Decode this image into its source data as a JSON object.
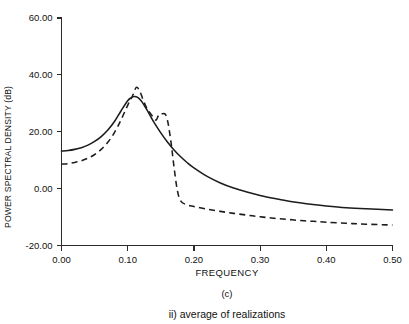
{
  "figure": {
    "panel_label": "(c)",
    "caption": "ii) average of realizations"
  },
  "chart_data": {
    "type": "line",
    "title": "",
    "xlabel": "FREQUENCY",
    "ylabel": "POWER SPECTRAL DENSITY (dB)",
    "xlim": [
      0.0,
      0.5
    ],
    "ylim": [
      -20.0,
      60.0
    ],
    "grid": false,
    "legend": "none",
    "xticks": [
      0.0,
      0.1,
      0.2,
      0.3,
      0.4,
      0.5
    ],
    "xticklabels": [
      "0.00",
      "0.10",
      "0.20",
      "0.30",
      "0.40",
      "0.50"
    ],
    "yticks": [
      -20.0,
      0.0,
      20.0,
      40.0,
      60.0
    ],
    "yticklabels": [
      "-20.00",
      "0.00",
      "20.00",
      "40.00",
      "60.00"
    ],
    "series": [
      {
        "name": "solid-curve",
        "style": "solid",
        "color": "#1c1c1c",
        "x": [
          0.0,
          0.01,
          0.02,
          0.03,
          0.04,
          0.05,
          0.06,
          0.07,
          0.08,
          0.09,
          0.1,
          0.105,
          0.11,
          0.115,
          0.12,
          0.125,
          0.13,
          0.135,
          0.14,
          0.15,
          0.16,
          0.17,
          0.18,
          0.19,
          0.2,
          0.22,
          0.24,
          0.26,
          0.28,
          0.3,
          0.32,
          0.34,
          0.36,
          0.38,
          0.4,
          0.43,
          0.46,
          0.5
        ],
        "y": [
          13.2,
          13.4,
          13.8,
          14.4,
          15.3,
          16.6,
          18.3,
          20.6,
          23.6,
          27.4,
          30.9,
          31.9,
          32.4,
          32.1,
          31.0,
          29.3,
          27.3,
          25.2,
          23.2,
          19.6,
          16.4,
          13.6,
          11.2,
          9.1,
          7.3,
          4.3,
          2.0,
          0.2,
          -1.2,
          -2.4,
          -3.4,
          -4.3,
          -5.0,
          -5.6,
          -6.1,
          -6.7,
          -7.1,
          -7.5
        ]
      },
      {
        "name": "dashed-curve",
        "style": "dashed",
        "color": "#1c1c1c",
        "x": [
          0.0,
          0.01,
          0.02,
          0.03,
          0.04,
          0.05,
          0.06,
          0.07,
          0.08,
          0.09,
          0.1,
          0.108,
          0.113,
          0.118,
          0.123,
          0.128,
          0.133,
          0.138,
          0.143,
          0.147,
          0.152,
          0.157,
          0.161,
          0.166,
          0.17,
          0.175,
          0.18,
          0.188,
          0.2,
          0.22,
          0.24,
          0.26,
          0.28,
          0.3,
          0.32,
          0.34,
          0.36,
          0.38,
          0.4,
          0.43,
          0.46,
          0.5
        ],
        "y": [
          8.6,
          8.8,
          9.2,
          9.8,
          10.7,
          12.0,
          13.8,
          16.3,
          19.7,
          24.2,
          29.3,
          33.0,
          35.6,
          34.4,
          31.4,
          28.7,
          26.9,
          25.3,
          24.1,
          26.0,
          26.3,
          26.1,
          23.0,
          15.3,
          7.5,
          -0.6,
          -4.3,
          -5.6,
          -6.3,
          -7.2,
          -8.0,
          -8.7,
          -9.3,
          -9.9,
          -10.4,
          -10.8,
          -11.2,
          -11.5,
          -11.8,
          -12.2,
          -12.5,
          -12.8
        ]
      }
    ]
  }
}
